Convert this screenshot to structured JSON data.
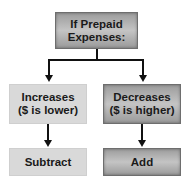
{
  "diagram": {
    "root": {
      "label_line1": "If Prepaid",
      "label_line2": "Expenses:"
    },
    "left_branch": {
      "condition_line1": "Increases",
      "condition_line2": "($ is lower)",
      "action": "Subtract"
    },
    "right_branch": {
      "condition_line1": "Decreases",
      "condition_line2": "($ is higher)",
      "action": "Add"
    },
    "colors": {
      "dark_box": "#b0b0b0",
      "light_box": "#d9d9d9",
      "line": "#111111"
    }
  }
}
